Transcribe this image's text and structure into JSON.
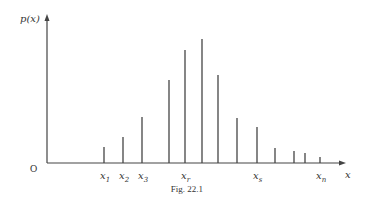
{
  "chart_data": {
    "type": "bar",
    "subtype": "discrete-probability-spikes",
    "title": "",
    "caption": "Fig. 22.1",
    "ylabel": "p(x)",
    "xlabel": "x",
    "origin_label": "O",
    "grid": false,
    "legend": null,
    "colors": {
      "stroke": "#444444",
      "text": "#333333",
      "background": "#ffffff"
    },
    "x_positions": [
      104,
      123,
      142,
      169,
      185,
      202,
      218,
      237,
      257,
      275,
      294,
      305,
      320
    ],
    "values": [
      16,
      26,
      46,
      83,
      113,
      124,
      88,
      45,
      36,
      15,
      12,
      10,
      6
    ],
    "tick_labels": [
      {
        "base": "x",
        "sub": "1",
        "x": 104
      },
      {
        "base": "x",
        "sub": "2",
        "x": 123
      },
      {
        "base": "x",
        "sub": "3",
        "x": 142
      },
      {
        "base": "x",
        "sub": "r",
        "x": 185
      },
      {
        "base": "x",
        "sub": "s",
        "x": 257
      },
      {
        "base": "x",
        "sub": "n",
        "x": 320
      }
    ],
    "axes": {
      "origin": [
        47,
        163
      ],
      "y_top": 14,
      "x_right": 346
    }
  }
}
